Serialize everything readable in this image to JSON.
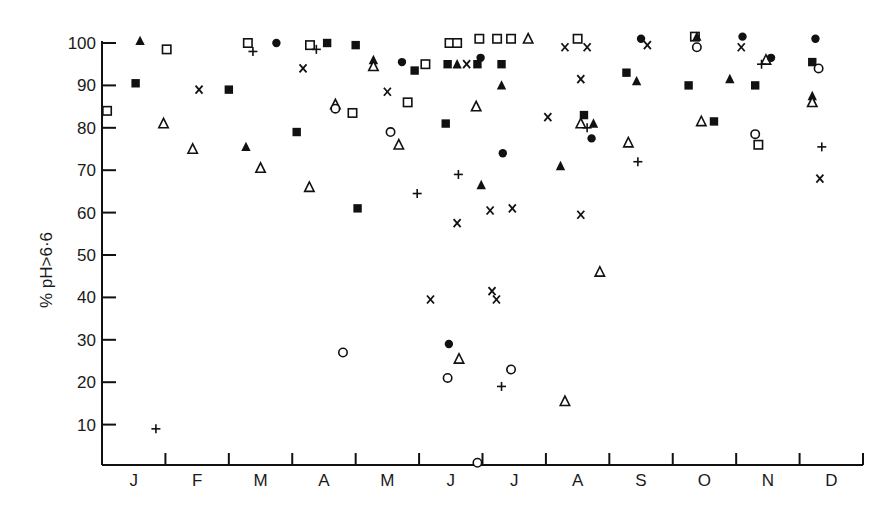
{
  "chart_data": {
    "type": "scatter",
    "title": "",
    "xlabel": "",
    "ylabel": "% pH>6·6",
    "x_categories": [
      "J",
      "F",
      "M",
      "A",
      "M",
      "J",
      "J",
      "A",
      "S",
      "O",
      "N",
      "D"
    ],
    "xlim": [
      0,
      12
    ],
    "ylim": [
      0,
      100
    ],
    "y_ticks": [
      10,
      20,
      30,
      40,
      50,
      60,
      70,
      80,
      90,
      100
    ],
    "grid": false,
    "legend": null,
    "note": "x = fractional month position (0 = start of January, 12 = end of December); six unlabeled marker series",
    "series": [
      {
        "name": "filled-square",
        "marker": "square-filled",
        "points": [
          [
            0.53,
            90.5
          ],
          [
            2.0,
            89
          ],
          [
            3.07,
            79
          ],
          [
            3.55,
            100
          ],
          [
            4.0,
            99.5
          ],
          [
            4.03,
            61
          ],
          [
            4.93,
            93.5
          ],
          [
            5.42,
            81
          ],
          [
            5.45,
            95
          ],
          [
            5.92,
            95
          ],
          [
            6.3,
            95
          ],
          [
            7.6,
            83
          ],
          [
            8.27,
            93
          ],
          [
            9.25,
            90
          ],
          [
            9.65,
            81.5
          ],
          [
            10.3,
            90
          ],
          [
            11.2,
            95.5
          ]
        ]
      },
      {
        "name": "open-square",
        "marker": "square-open",
        "points": [
          [
            0.08,
            84
          ],
          [
            1.02,
            98.5
          ],
          [
            2.3,
            100
          ],
          [
            3.28,
            99.5
          ],
          [
            3.95,
            83.5
          ],
          [
            4.82,
            86
          ],
          [
            5.1,
            95
          ],
          [
            5.48,
            100
          ],
          [
            5.6,
            100
          ],
          [
            5.95,
            101
          ],
          [
            6.23,
            101
          ],
          [
            6.45,
            101
          ],
          [
            7.5,
            101
          ],
          [
            9.35,
            101.5
          ],
          [
            10.35,
            76
          ]
        ]
      },
      {
        "name": "filled-triangle",
        "marker": "triangle-filled",
        "points": [
          [
            0.6,
            100.5
          ],
          [
            2.27,
            75.5
          ],
          [
            4.28,
            96
          ],
          [
            5.6,
            95
          ],
          [
            5.98,
            66.5
          ],
          [
            6.3,
            90
          ],
          [
            7.23,
            71
          ],
          [
            7.75,
            81
          ],
          [
            8.43,
            91
          ],
          [
            9.38,
            101.5
          ],
          [
            9.9,
            91.5
          ],
          [
            11.2,
            87.5
          ]
        ]
      },
      {
        "name": "open-triangle",
        "marker": "triangle-open",
        "points": [
          [
            0.97,
            81
          ],
          [
            1.43,
            75
          ],
          [
            2.5,
            70.5
          ],
          [
            3.27,
            66
          ],
          [
            3.68,
            85.5
          ],
          [
            4.28,
            94.5
          ],
          [
            4.68,
            76
          ],
          [
            5.9,
            85
          ],
          [
            5.63,
            25.5
          ],
          [
            6.72,
            101
          ],
          [
            7.3,
            15.5
          ],
          [
            7.55,
            81
          ],
          [
            7.85,
            46
          ],
          [
            8.3,
            76.5
          ],
          [
            9.45,
            81.5
          ],
          [
            10.47,
            96
          ],
          [
            11.2,
            86
          ]
        ]
      },
      {
        "name": "filled-circle",
        "marker": "circle-filled",
        "points": [
          [
            2.75,
            100
          ],
          [
            4.73,
            95.5
          ],
          [
            5.47,
            29
          ],
          [
            5.97,
            96.5
          ],
          [
            6.32,
            74
          ],
          [
            7.72,
            77.5
          ],
          [
            8.5,
            101
          ],
          [
            10.1,
            101.5
          ],
          [
            10.55,
            96.5
          ],
          [
            11.25,
            101
          ]
        ]
      },
      {
        "name": "open-circle",
        "marker": "circle-open",
        "points": [
          [
            3.68,
            84.5
          ],
          [
            3.8,
            27
          ],
          [
            4.55,
            79
          ],
          [
            5.45,
            21
          ],
          [
            5.92,
            1
          ],
          [
            6.45,
            23
          ],
          [
            9.38,
            99
          ],
          [
            10.3,
            78.5
          ],
          [
            11.3,
            94
          ]
        ]
      },
      {
        "name": "cross-x",
        "marker": "x",
        "points": [
          [
            1.53,
            89
          ],
          [
            3.17,
            94
          ],
          [
            4.5,
            88.5
          ],
          [
            5.18,
            39.5
          ],
          [
            5.6,
            57.5
          ],
          [
            5.75,
            95
          ],
          [
            6.12,
            60.5
          ],
          [
            6.15,
            41.5
          ],
          [
            6.22,
            39.5
          ],
          [
            6.47,
            61
          ],
          [
            7.03,
            82.5
          ],
          [
            7.3,
            99
          ],
          [
            7.55,
            59.5
          ],
          [
            7.55,
            91.5
          ],
          [
            7.65,
            99
          ],
          [
            8.6,
            99.5
          ],
          [
            10.08,
            99
          ],
          [
            11.32,
            68
          ]
        ]
      },
      {
        "name": "plus",
        "marker": "plus",
        "points": [
          [
            0.85,
            9
          ],
          [
            2.38,
            98
          ],
          [
            3.38,
            98.5
          ],
          [
            4.97,
            64.5
          ],
          [
            5.62,
            69
          ],
          [
            6.3,
            19
          ],
          [
            7.65,
            80
          ],
          [
            8.45,
            72
          ],
          [
            10.4,
            95
          ],
          [
            11.35,
            75.5
          ]
        ]
      }
    ]
  },
  "axes": {
    "y_axis_title": "% pH>6·6",
    "y_tick_labels": [
      "10",
      "20",
      "30",
      "40",
      "50",
      "60",
      "70",
      "80",
      "90",
      "100"
    ],
    "x_month_labels": [
      "J",
      "F",
      "M",
      "A",
      "M",
      "J",
      "J",
      "A",
      "S",
      "O",
      "N",
      "D"
    ]
  }
}
